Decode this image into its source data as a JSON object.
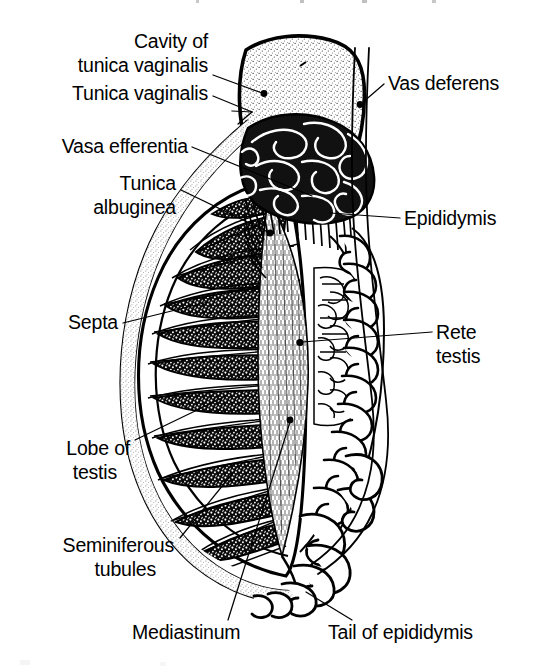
{
  "figure": {
    "kind": "anatomical-line-drawing",
    "background_color": "#ffffff",
    "ink_color": "#000000",
    "width": 544,
    "height": 672
  },
  "labels": [
    {
      "id": "cavity-of-tunica-vaginalis",
      "lines": [
        "Cavity of",
        "tunica vaginalis"
      ],
      "anchor": "end",
      "x": 208,
      "y": 48,
      "line_height": 24
    },
    {
      "id": "tunica-vaginalis",
      "lines": [
        "Tunica vaginalis"
      ],
      "anchor": "end",
      "x": 208,
      "y": 100,
      "line_height": 24
    },
    {
      "id": "vas-deferens",
      "lines": [
        "Vas deferens"
      ],
      "anchor": "start",
      "x": 388,
      "y": 90,
      "line_height": 24
    },
    {
      "id": "vasa-efferentia",
      "lines": [
        "Vasa efferentia"
      ],
      "anchor": "end",
      "x": 188,
      "y": 153,
      "line_height": 24
    },
    {
      "id": "tunica-albuginea",
      "lines": [
        "Tunica",
        "albuginea"
      ],
      "anchor": "end",
      "x": 176,
      "y": 190,
      "line_height": 24
    },
    {
      "id": "epididymis",
      "lines": [
        "Epididymis"
      ],
      "anchor": "start",
      "x": 404,
      "y": 225,
      "line_height": 24
    },
    {
      "id": "septa",
      "lines": [
        "Septa"
      ],
      "anchor": "end",
      "x": 118,
      "y": 329,
      "line_height": 24
    },
    {
      "id": "rete-testis",
      "lines": [
        "Rete",
        "testis"
      ],
      "anchor": "start",
      "x": 436,
      "y": 339,
      "line_height": 24
    },
    {
      "id": "lobe-of-testis",
      "lines": [
        "Lobe of",
        "testis"
      ],
      "anchor": "end",
      "x": 130,
      "y": 455,
      "line_height": 24
    },
    {
      "id": "seminiferous-tubules",
      "lines": [
        "Seminiferous",
        "tubules"
      ],
      "anchor": "end",
      "x": 174,
      "y": 552,
      "line_height": 24
    },
    {
      "id": "mediastinum",
      "lines": [
        "Mediastinum"
      ],
      "anchor": "start",
      "x": 132,
      "y": 639,
      "line_height": 24
    },
    {
      "id": "tail-of-epididymis",
      "lines": [
        "Tail of epididymis"
      ],
      "anchor": "start",
      "x": 328,
      "y": 639,
      "line_height": 24
    }
  ],
  "structures": [
    {
      "id": "tunica-vaginalis-sac",
      "name": "Tunica vaginalis sac (stippled wedge)"
    },
    {
      "id": "testis-body",
      "name": "Testis body (ovoid, stippled capsule)"
    },
    {
      "id": "testis-lobes",
      "name": "Lobes of testis (wedge-shaped stippled lobules)",
      "count": 11
    },
    {
      "id": "septa-lines",
      "name": "Septa between lobules"
    },
    {
      "id": "mediastinum-testis",
      "name": "Mediastinum testis (central fibrous mass)"
    },
    {
      "id": "rete-testis-network",
      "name": "Rete testis (anastomosing channel network)"
    },
    {
      "id": "vasa-efferentia-ducts",
      "name": "Vasa efferentia (fan of fine ducts)",
      "count": 18
    },
    {
      "id": "epididymis-head",
      "name": "Head of epididymis (dense coiled mass)"
    },
    {
      "id": "epididymis-body",
      "name": "Body of epididymis (coiled duct column)"
    },
    {
      "id": "epididymis-tail",
      "name": "Tail of epididymis (loose lower coils)"
    },
    {
      "id": "vas-deferens-duct",
      "name": "Vas deferens (paired straight duct lines)"
    }
  ]
}
